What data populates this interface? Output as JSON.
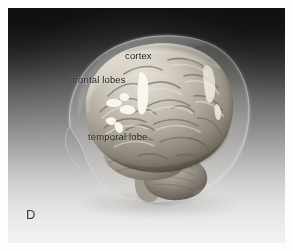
{
  "figure": {
    "panel_letter": "D",
    "background": {
      "gradient_top_color": "#111111",
      "gradient_bottom_color": "#f1f1f1",
      "border_color": "#ffffff",
      "plate_width": 277,
      "plate_height": 235
    },
    "labels": [
      {
        "id": "cortex",
        "text": "cortex",
        "x": 117,
        "y": 42,
        "color": "#16181a"
      },
      {
        "id": "frontal",
        "text": "frontal lobes",
        "x": 64,
        "y": 66,
        "color": "#16181a"
      },
      {
        "id": "temporal",
        "text": "temporal lobe",
        "x": 80,
        "y": 123,
        "color": "#16181a"
      }
    ],
    "anatomy": {
      "subject": "3D rendered human brain inside translucent head",
      "view": "left lateral oblique",
      "brain_surface_color": "#b9b2a6",
      "brain_shadow_color": "#5d5850",
      "brain_highlight_color": "#efeae0",
      "head_outline_color": "#cfcac2",
      "sulci_color": "#726c62",
      "structures": [
        "cerebral cortex",
        "frontal lobes",
        "temporal lobe",
        "occipital lobe",
        "cerebellum",
        "brain stem",
        "translucent skull and face profile"
      ]
    }
  }
}
